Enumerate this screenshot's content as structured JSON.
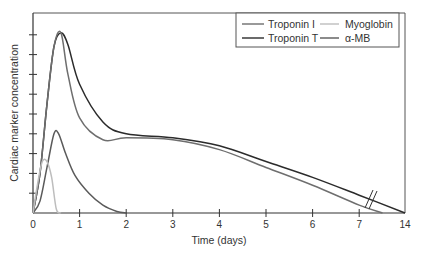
{
  "chart_data": {
    "type": "line",
    "title": "",
    "xlabel": "Time (days)",
    "ylabel": "Cardiac marker concentration",
    "x_tick_labels": [
      "0",
      "1",
      "2",
      "3",
      "4",
      "5",
      "6",
      "7",
      "14"
    ],
    "x_axis_note": "Axis break between 7 and 14 days",
    "y_tick_count": 9,
    "y_tick_labels": [],
    "grid": false,
    "legend_position": "top-right",
    "legend": [
      {
        "name": "Troponin I",
        "color": "#6e6e6e"
      },
      {
        "name": "Troponin T",
        "color": "#2b2b2b"
      },
      {
        "name": "Myoglobin",
        "color": "#bdbdbd"
      },
      {
        "name": "α-MB",
        "color": "#5a5a5a"
      }
    ],
    "series": [
      {
        "name": "Troponin T",
        "color": "#2b2b2b",
        "x": [
          0,
          0.15,
          0.3,
          0.45,
          0.6,
          0.75,
          1.0,
          1.5,
          2.0,
          3.0,
          4.0,
          5.0,
          6.0,
          7.0,
          14
        ],
        "y": [
          0,
          2.0,
          5.5,
          8.4,
          9.1,
          8.5,
          6.5,
          4.6,
          4.0,
          3.8,
          3.4,
          2.6,
          1.8,
          0.9,
          0
        ]
      },
      {
        "name": "Troponin I",
        "color": "#6e6e6e",
        "x": [
          0,
          0.15,
          0.3,
          0.45,
          0.6,
          0.75,
          1.0,
          1.5,
          2.0,
          3.0,
          4.0,
          5.0,
          6.0,
          7.0,
          7.5
        ],
        "y": [
          0,
          2.0,
          5.5,
          8.4,
          9.1,
          7.0,
          4.8,
          3.7,
          3.8,
          3.7,
          3.2,
          2.3,
          1.4,
          0.4,
          0
        ]
      },
      {
        "name": "α-MB",
        "color": "#5a5a5a",
        "x": [
          0,
          0.15,
          0.3,
          0.45,
          0.55,
          0.7,
          0.9,
          1.2,
          1.5,
          1.8,
          2.0
        ],
        "y": [
          0,
          0.6,
          2.3,
          4.0,
          4.0,
          3.0,
          1.9,
          1.0,
          0.4,
          0.08,
          0
        ]
      },
      {
        "name": "Myoglobin",
        "color": "#bdbdbd",
        "x": [
          0,
          0.1,
          0.2,
          0.3,
          0.4,
          0.5,
          0.6
        ],
        "y": [
          0,
          1.5,
          2.6,
          2.6,
          1.8,
          0.2,
          0
        ]
      }
    ]
  }
}
